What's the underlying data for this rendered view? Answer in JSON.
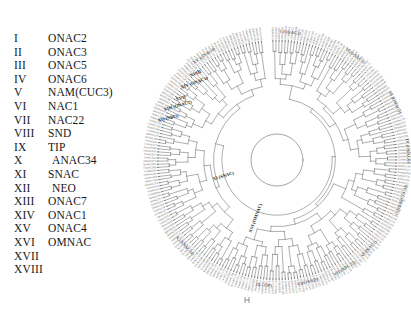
{
  "figure": {
    "background_color": "#ffffff",
    "line_color": "#4a4a4a",
    "text_color": "#1a1a1a",
    "tip_label_color": "#6a6a6a"
  },
  "legend": {
    "rows": [
      {
        "numeral": "I",
        "name": "ONAC2"
      },
      {
        "numeral": "II",
        "name": "ONAC3"
      },
      {
        "numeral": "III",
        "name": "ONAC5"
      },
      {
        "numeral": "IV",
        "name": "ONAC6"
      },
      {
        "numeral": "V",
        "name": "NAM(CUC3)"
      },
      {
        "numeral": "VI",
        "name": "NAC1"
      },
      {
        "numeral": "VII",
        "name": "NAC22"
      },
      {
        "numeral": "VIII",
        "name": "SND"
      },
      {
        "numeral": "IX",
        "name": "TIP"
      },
      {
        "numeral": "X",
        "name": "ANAC34"
      },
      {
        "numeral": "XI",
        "name": "SNAC"
      },
      {
        "numeral": "XII",
        "name": "NEO"
      },
      {
        "numeral": "XIII",
        "name": "ONAC7"
      },
      {
        "numeral": "XIV",
        "name": "ONAC1"
      },
      {
        "numeral": "XV",
        "name": "ONAC4"
      },
      {
        "numeral": "XVI",
        "name": "OMNAC"
      },
      {
        "numeral": "XVII",
        "name": ""
      },
      {
        "numeral": "XVIII",
        "name": ""
      }
    ]
  },
  "tree": {
    "type": "circular-cladogram",
    "center": {
      "x": 134,
      "y": 160
    },
    "inner_radius": 26,
    "outer_radius": 120,
    "tip_count": 240,
    "arc_clades": [
      {
        "label": "I (ONAC2)",
        "angle_deg": -84,
        "radius": 128
      },
      {
        "label": "II (ONAC3)",
        "angle_deg": -53,
        "radius": 130
      },
      {
        "label": "III (ONAC5)",
        "angle_deg": -26,
        "radius": 131
      },
      {
        "label": "IV (ONAC6)",
        "angle_deg": -4,
        "radius": 131
      },
      {
        "label": "V (NAM(CUC3))",
        "angle_deg": 18,
        "radius": 131
      },
      {
        "label": "VI (NAC1)",
        "angle_deg": 44,
        "radius": 128
      },
      {
        "label": "VII (NAC22)",
        "angle_deg": 58,
        "radius": 128
      },
      {
        "label": "VIII (SND)",
        "angle_deg": 76,
        "radius": 126
      },
      {
        "label": "IX (TIP)",
        "angle_deg": 96,
        "radius": 126
      },
      {
        "label": "X (ANAC34)",
        "angle_deg": 137,
        "radius": 126
      },
      {
        "label": "XV (ONAC4)",
        "angle_deg": -125,
        "radius": 127
      }
    ],
    "radial_clades": [
      {
        "label": "XVI (OMNAC)",
        "angle_deg": 110,
        "radius": 62
      },
      {
        "label": "XI (SNAC)",
        "angle_deg": 163,
        "radius": 56
      }
    ],
    "inner_clades": [
      {
        "label": "XVIII",
        "x": 47,
        "y": 76
      },
      {
        "label": "XIV (ONAC1)",
        "x": 38,
        "y": 88
      },
      {
        "label": "XVII",
        "x": 33,
        "y": 100
      },
      {
        "label": "XIII (ONAC7)",
        "x": 21,
        "y": 110
      },
      {
        "label": "XII (NEO)",
        "x": 15,
        "y": 121
      }
    ],
    "scalebar": {
      "label": "IX (TIP)",
      "x": 102,
      "y": 300
    }
  }
}
